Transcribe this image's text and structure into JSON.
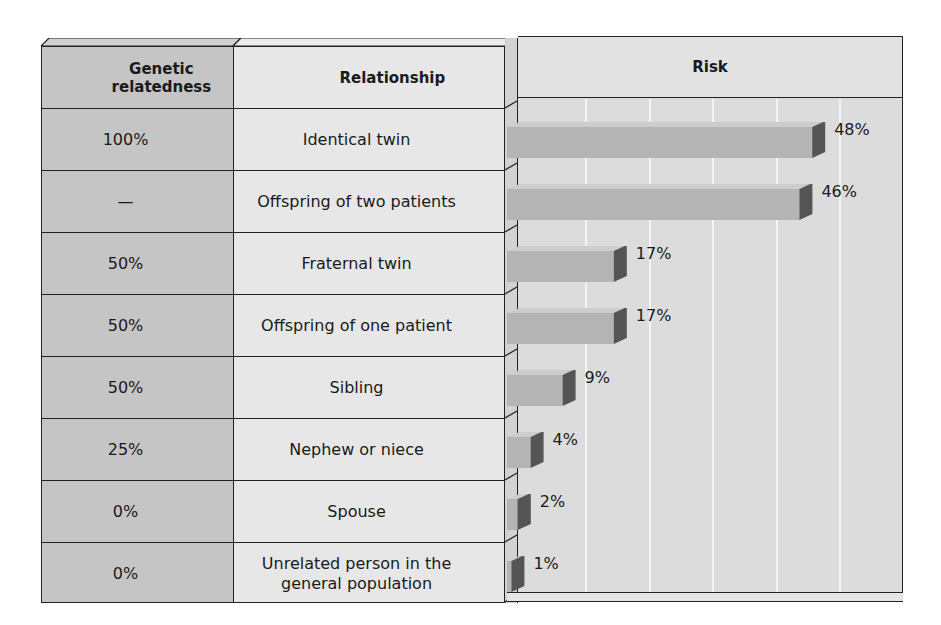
{
  "table": {
    "headers": {
      "relatedness": "Genetic relatedness",
      "relationship": "Relationship",
      "risk": "Risk"
    },
    "rows": [
      {
        "relatedness": "100%",
        "relationship": "Identical twin",
        "risk": "48%"
      },
      {
        "relatedness": "—",
        "relationship": "Offspring of two patients",
        "risk": "46%"
      },
      {
        "relatedness": "50%",
        "relationship": "Fraternal twin",
        "risk": "17%"
      },
      {
        "relatedness": "50%",
        "relationship": "Offspring of one patient",
        "risk": "17%"
      },
      {
        "relatedness": "50%",
        "relationship": "Sibling",
        "risk": "9%"
      },
      {
        "relatedness": "25%",
        "relationship": "Nephew or niece",
        "risk": "4%"
      },
      {
        "relatedness": "0%",
        "relationship": "Spouse",
        "risk": "2%"
      },
      {
        "relatedness": "0%",
        "relationship": "Unrelated person in the general population",
        "risk": "1%"
      }
    ]
  },
  "colors": {
    "relatedness_col": "#c5c5c5",
    "relationship_col": "#e7e7e7",
    "risk_panel": "#dcdcdc",
    "bar_front": "#b4b4b4",
    "bar_end": "#555555",
    "gridline": "#f5f5f5"
  },
  "chart_data": {
    "type": "bar",
    "orientation": "horizontal",
    "title": "Risk",
    "categories": [
      "Identical twin",
      "Offspring of two patients",
      "Fraternal twin",
      "Offspring of one patient",
      "Sibling",
      "Nephew or niece",
      "Spouse",
      "Unrelated person in the general population"
    ],
    "genetic_relatedness": [
      "100%",
      "—",
      "50%",
      "50%",
      "50%",
      "25%",
      "0%",
      "0%"
    ],
    "values": [
      48,
      46,
      17,
      17,
      9,
      4,
      2,
      1
    ],
    "value_labels": [
      "48%",
      "46%",
      "17%",
      "17%",
      "9%",
      "4%",
      "2%",
      "1%"
    ],
    "xlabel": "",
    "ylabel": "",
    "xlim": [
      0,
      60
    ],
    "grid": true,
    "grid_interval": 10,
    "legend": null
  }
}
